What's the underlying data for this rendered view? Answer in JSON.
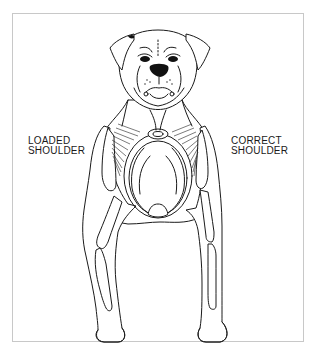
{
  "figure": {
    "labels": {
      "left_line1": "LOADED",
      "left_line2": "SHOULDER",
      "right_line1": "CORRECT",
      "right_line2": "SHOULDER"
    },
    "colors": {
      "line": "#1a1a1a",
      "frame_border": "#c8c8c8",
      "background": "#ffffff"
    }
  }
}
